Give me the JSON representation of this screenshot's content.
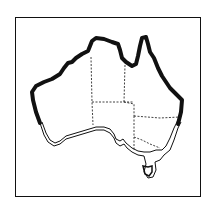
{
  "map": {
    "title": "Australia",
    "description": "Outline map of Australia with state borders; northern, western and eastern coasts highlighted with a thick line, southern coast shown with a double outline",
    "colors": {
      "outline": "#111111",
      "background": "#ffffff"
    },
    "regions": [
      "Western Australia",
      "Northern Territory",
      "Queensland",
      "South Australia",
      "New South Wales",
      "Victoria",
      "Tasmania"
    ]
  }
}
